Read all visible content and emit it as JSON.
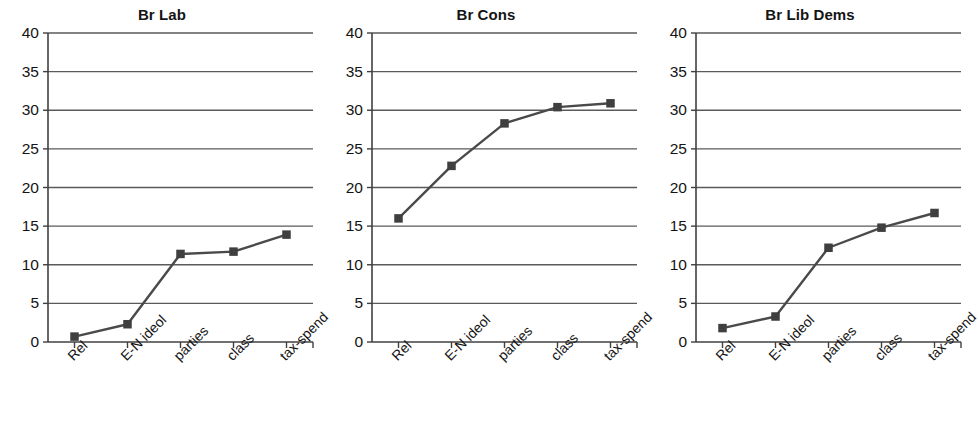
{
  "figure": {
    "background_color": "#ffffff",
    "line_color": "#4a4a4a",
    "marker_color": "#3f3f3f",
    "grid_color": "#5a5a5a",
    "axis_color": "#404040",
    "text_color": "#141414"
  },
  "chart_data": [
    {
      "type": "line",
      "title": "Br Lab",
      "categories": [
        "Rel",
        "E-N ideol",
        "parties",
        "class",
        "tax-spend"
      ],
      "values": [
        0.7,
        2.3,
        11.4,
        11.7,
        13.9
      ],
      "xlabel": "",
      "ylabel": "",
      "ylim": [
        0,
        40
      ],
      "yticks": [
        0,
        5,
        10,
        15,
        20,
        25,
        30,
        35,
        40
      ],
      "grid": true,
      "legend": "none",
      "marker": "square"
    },
    {
      "type": "line",
      "title": "Br Cons",
      "categories": [
        "Rel",
        "E-N ideol",
        "parties",
        "class",
        "tax-spend"
      ],
      "values": [
        16.0,
        22.8,
        28.3,
        30.4,
        30.9
      ],
      "xlabel": "",
      "ylabel": "",
      "ylim": [
        0,
        40
      ],
      "yticks": [
        0,
        5,
        10,
        15,
        20,
        25,
        30,
        35,
        40
      ],
      "grid": true,
      "legend": "none",
      "marker": "square"
    },
    {
      "type": "line",
      "title": "Br Lib Dems",
      "categories": [
        "Rel",
        "E-N ideol",
        "parties",
        "class",
        "tax-spend"
      ],
      "values": [
        1.8,
        3.3,
        12.2,
        14.8,
        16.7
      ],
      "xlabel": "",
      "ylabel": "",
      "ylim": [
        0,
        40
      ],
      "yticks": [
        0,
        5,
        10,
        15,
        20,
        25,
        30,
        35,
        40
      ],
      "grid": true,
      "legend": "none",
      "marker": "square"
    }
  ]
}
